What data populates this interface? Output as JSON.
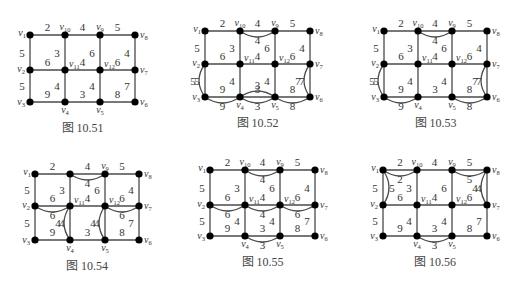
{
  "colors": {
    "edge": "#4a4a4a",
    "node": "#000000",
    "text": "#333333",
    "background": "#ffffff"
  },
  "figures": [
    {
      "caption": "图 10.51",
      "nodes": {
        "v1": [
          30,
          35
        ],
        "v10": [
          65,
          35
        ],
        "v9": [
          100,
          35
        ],
        "v8": [
          135,
          35
        ],
        "v2": [
          30,
          70
        ],
        "v11": [
          65,
          70
        ],
        "v12": [
          100,
          70
        ],
        "v7": [
          135,
          70
        ],
        "v3": [
          30,
          102
        ],
        "v4": [
          65,
          102
        ],
        "v5": [
          100,
          102
        ],
        "v6": [
          135,
          102
        ]
      },
      "edges": [
        {
          "a": "v1",
          "b": "v10",
          "w": "2"
        },
        {
          "a": "v10",
          "b": "v9",
          "w": "4"
        },
        {
          "a": "v9",
          "b": "v8",
          "w": "5"
        },
        {
          "a": "v1",
          "b": "v2",
          "w": "5"
        },
        {
          "a": "v10",
          "b": "v11",
          "w": "3"
        },
        {
          "a": "v9",
          "b": "v12",
          "w": "6"
        },
        {
          "a": "v8",
          "b": "v7",
          "w": "4"
        },
        {
          "a": "v2",
          "b": "v11",
          "w": "6"
        },
        {
          "a": "v11",
          "b": "v12",
          "w": "4"
        },
        {
          "a": "v12",
          "b": "v7",
          "w": "6"
        },
        {
          "a": "v2",
          "b": "v3",
          "w": "5"
        },
        {
          "a": "v11",
          "b": "v4",
          "w": "4"
        },
        {
          "a": "v12",
          "b": "v5",
          "w": "4"
        },
        {
          "a": "v7",
          "b": "v6",
          "w": "7"
        },
        {
          "a": "v3",
          "b": "v4",
          "w": "9"
        },
        {
          "a": "v4",
          "b": "v5",
          "w": "3"
        },
        {
          "a": "v5",
          "b": "v6",
          "w": "8"
        }
      ],
      "extra_edges": []
    },
    {
      "caption": "图 10.52",
      "nodes": {
        "v1": [
          205,
          31
        ],
        "v10": [
          240,
          31
        ],
        "v9": [
          275,
          31
        ],
        "v8": [
          310,
          31
        ],
        "v2": [
          205,
          64
        ],
        "v11": [
          240,
          64
        ],
        "v12": [
          275,
          64
        ],
        "v7": [
          310,
          64
        ],
        "v3": [
          205,
          97
        ],
        "v4": [
          240,
          97
        ],
        "v5": [
          275,
          97
        ],
        "v6": [
          310,
          97
        ]
      },
      "edges": [
        {
          "a": "v1",
          "b": "v10",
          "w": "2"
        },
        {
          "a": "v10",
          "b": "v9",
          "w": "4"
        },
        {
          "a": "v9",
          "b": "v8",
          "w": "5"
        },
        {
          "a": "v1",
          "b": "v2",
          "w": "5"
        },
        {
          "a": "v10",
          "b": "v11",
          "w": "3"
        },
        {
          "a": "v9",
          "b": "v12",
          "w": "6"
        },
        {
          "a": "v8",
          "b": "v7",
          "w": "4"
        },
        {
          "a": "v2",
          "b": "v11",
          "w": "6"
        },
        {
          "a": "v11",
          "b": "v12",
          "w": "4"
        },
        {
          "a": "v12",
          "b": "v7",
          "w": "6"
        },
        {
          "a": "v2",
          "b": "v3",
          "w": "5"
        },
        {
          "a": "v11",
          "b": "v4",
          "w": "4"
        },
        {
          "a": "v12",
          "b": "v5",
          "w": "4"
        },
        {
          "a": "v7",
          "b": "v6",
          "w": "7"
        },
        {
          "a": "v3",
          "b": "v4",
          "w": "9"
        },
        {
          "a": "v4",
          "b": "v5",
          "w": "3"
        },
        {
          "a": "v5",
          "b": "v6",
          "w": "8"
        }
      ],
      "extra_edges": [
        {
          "a": "v10",
          "b": "v9",
          "w": "4",
          "bend": "down"
        },
        {
          "a": "v2",
          "b": "v3",
          "w": "5",
          "bend": "left"
        },
        {
          "a": "v7",
          "b": "v6",
          "w": "7",
          "bend": "left"
        },
        {
          "a": "v3",
          "b": "v4",
          "w": "9",
          "bend": "down"
        },
        {
          "a": "v4",
          "b": "v5",
          "w": "3",
          "bend": "up"
        },
        {
          "a": "v4",
          "b": "v5",
          "w": "3",
          "bend": "down"
        },
        {
          "a": "v5",
          "b": "v6",
          "w": "8",
          "bend": "down"
        }
      ]
    },
    {
      "caption": "图 10.53",
      "nodes": {
        "v1": [
          384,
          31
        ],
        "v10": [
          418,
          31
        ],
        "v9": [
          452,
          31
        ],
        "v8": [
          487,
          31
        ],
        "v2": [
          384,
          64
        ],
        "v11": [
          418,
          64
        ],
        "v12": [
          452,
          64
        ],
        "v7": [
          487,
          64
        ],
        "v3": [
          384,
          97
        ],
        "v4": [
          418,
          97
        ],
        "v5": [
          452,
          97
        ],
        "v6": [
          487,
          97
        ]
      },
      "edges": [
        {
          "a": "v1",
          "b": "v10",
          "w": "2"
        },
        {
          "a": "v10",
          "b": "v9",
          "w": "4"
        },
        {
          "a": "v9",
          "b": "v8",
          "w": "5"
        },
        {
          "a": "v1",
          "b": "v2",
          "w": "5"
        },
        {
          "a": "v10",
          "b": "v11",
          "w": "3"
        },
        {
          "a": "v9",
          "b": "v12",
          "w": "6"
        },
        {
          "a": "v8",
          "b": "v7",
          "w": "4"
        },
        {
          "a": "v2",
          "b": "v11",
          "w": "6"
        },
        {
          "a": "v11",
          "b": "v12",
          "w": "4"
        },
        {
          "a": "v12",
          "b": "v7",
          "w": "6"
        },
        {
          "a": "v2",
          "b": "v3",
          "w": "5"
        },
        {
          "a": "v11",
          "b": "v4",
          "w": "4"
        },
        {
          "a": "v12",
          "b": "v5",
          "w": "4"
        },
        {
          "a": "v7",
          "b": "v6",
          "w": "7"
        },
        {
          "a": "v3",
          "b": "v4",
          "w": "9"
        },
        {
          "a": "v4",
          "b": "v5",
          "w": "3"
        },
        {
          "a": "v5",
          "b": "v6",
          "w": "8"
        }
      ],
      "extra_edges": [
        {
          "a": "v10",
          "b": "v9",
          "w": "4",
          "bend": "down"
        },
        {
          "a": "v2",
          "b": "v3",
          "w": "5",
          "bend": "left"
        },
        {
          "a": "v7",
          "b": "v6",
          "w": "7",
          "bend": "left"
        },
        {
          "a": "v3",
          "b": "v4",
          "w": "9",
          "bend": "down"
        },
        {
          "a": "v5",
          "b": "v6",
          "w": "8",
          "bend": "down"
        }
      ]
    },
    {
      "caption": "图 10.54",
      "nodes": {
        "v1": [
          35,
          174
        ],
        "v10": [
          70,
          174
        ],
        "v9": [
          105,
          174
        ],
        "v8": [
          139,
          174
        ],
        "v2": [
          35,
          206
        ],
        "v11": [
          70,
          206
        ],
        "v12": [
          105,
          206
        ],
        "v7": [
          139,
          206
        ],
        "v3": [
          35,
          240
        ],
        "v4": [
          70,
          240
        ],
        "v5": [
          105,
          240
        ],
        "v6": [
          139,
          240
        ]
      },
      "hidden_labels": [
        "v10"
      ],
      "edges": [
        {
          "a": "v1",
          "b": "v10",
          "w": "2"
        },
        {
          "a": "v10",
          "b": "v9",
          "w": "4"
        },
        {
          "a": "v9",
          "b": "v8",
          "w": "5"
        },
        {
          "a": "v1",
          "b": "v2",
          "w": "5"
        },
        {
          "a": "v10",
          "b": "v11",
          "w": "3"
        },
        {
          "a": "v9",
          "b": "v12",
          "w": "6"
        },
        {
          "a": "v8",
          "b": "v7",
          "w": "4"
        },
        {
          "a": "v2",
          "b": "v11",
          "w": "6"
        },
        {
          "a": "v11",
          "b": "v12",
          "w": "4"
        },
        {
          "a": "v12",
          "b": "v7",
          "w": "6"
        },
        {
          "a": "v2",
          "b": "v3",
          "w": "5"
        },
        {
          "a": "v11",
          "b": "v4",
          "w": "4"
        },
        {
          "a": "v12",
          "b": "v5",
          "w": "4"
        },
        {
          "a": "v7",
          "b": "v6",
          "w": "7"
        },
        {
          "a": "v3",
          "b": "v4",
          "w": "9"
        },
        {
          "a": "v4",
          "b": "v5",
          "w": "3"
        },
        {
          "a": "v5",
          "b": "v6",
          "w": "8"
        }
      ],
      "extra_edges": [
        {
          "a": "v10",
          "b": "v9",
          "w": "4",
          "bend": "down"
        },
        {
          "a": "v2",
          "b": "v11",
          "w": "6",
          "bend": "down"
        },
        {
          "a": "v11",
          "b": "v4",
          "w": "4",
          "bend": "left"
        },
        {
          "a": "v12",
          "b": "v5",
          "w": "4",
          "bend": "left"
        },
        {
          "a": "v12",
          "b": "v7",
          "w": "6",
          "bend": "down"
        }
      ]
    },
    {
      "caption": "图 10.55",
      "nodes": {
        "v1": [
          210,
          170
        ],
        "v10": [
          245,
          170
        ],
        "v9": [
          280,
          170
        ],
        "v8": [
          315,
          170
        ],
        "v2": [
          210,
          205
        ],
        "v11": [
          245,
          205
        ],
        "v12": [
          280,
          205
        ],
        "v7": [
          315,
          205
        ],
        "v3": [
          210,
          236
        ],
        "v4": [
          245,
          236
        ],
        "v5": [
          280,
          236
        ],
        "v6": [
          315,
          236
        ]
      },
      "edges": [
        {
          "a": "v1",
          "b": "v10",
          "w": "2"
        },
        {
          "a": "v10",
          "b": "v9",
          "w": "4"
        },
        {
          "a": "v9",
          "b": "v8",
          "w": "5"
        },
        {
          "a": "v1",
          "b": "v2",
          "w": "5"
        },
        {
          "a": "v10",
          "b": "v11",
          "w": "3"
        },
        {
          "a": "v9",
          "b": "v12",
          "w": "6"
        },
        {
          "a": "v8",
          "b": "v7",
          "w": "4"
        },
        {
          "a": "v2",
          "b": "v11",
          "w": "6"
        },
        {
          "a": "v11",
          "b": "v12",
          "w": "4"
        },
        {
          "a": "v12",
          "b": "v7",
          "w": "6"
        },
        {
          "a": "v2",
          "b": "v3",
          "w": "5"
        },
        {
          "a": "v11",
          "b": "v4",
          "w": "4"
        },
        {
          "a": "v12",
          "b": "v5",
          "w": "4"
        },
        {
          "a": "v7",
          "b": "v6",
          "w": "7"
        },
        {
          "a": "v3",
          "b": "v4",
          "w": "9"
        },
        {
          "a": "v4",
          "b": "v5",
          "w": "3"
        },
        {
          "a": "v5",
          "b": "v6",
          "w": "8"
        }
      ],
      "extra_edges": [
        {
          "a": "v10",
          "b": "v9",
          "w": "4",
          "bend": "down"
        },
        {
          "a": "v2",
          "b": "v11",
          "w": "6",
          "bend": "down"
        },
        {
          "a": "v11",
          "b": "v12",
          "w": "4",
          "bend": "down"
        },
        {
          "a": "v12",
          "b": "v7",
          "w": "6",
          "bend": "down"
        },
        {
          "a": "v4",
          "b": "v5",
          "w": "3",
          "bend": "down"
        }
      ]
    },
    {
      "caption": "图 10.56",
      "nodes": {
        "v1": [
          383,
          170
        ],
        "v10": [
          417,
          170
        ],
        "v9": [
          452,
          170
        ],
        "v8": [
          487,
          170
        ],
        "v2": [
          383,
          205
        ],
        "v11": [
          417,
          205
        ],
        "v12": [
          452,
          205
        ],
        "v7": [
          487,
          205
        ],
        "v3": [
          383,
          236
        ],
        "v4": [
          417,
          236
        ],
        "v5": [
          452,
          236
        ],
        "v6": [
          487,
          236
        ]
      },
      "edges": [
        {
          "a": "v1",
          "b": "v10",
          "w": "2"
        },
        {
          "a": "v10",
          "b": "v9",
          "w": "4"
        },
        {
          "a": "v9",
          "b": "v8",
          "w": "5"
        },
        {
          "a": "v1",
          "b": "v2",
          "w": "5"
        },
        {
          "a": "v10",
          "b": "v11",
          "w": "3"
        },
        {
          "a": "v9",
          "b": "v12",
          "w": "6"
        },
        {
          "a": "v8",
          "b": "v7",
          "w": "4"
        },
        {
          "a": "v2",
          "b": "v11",
          "w": "6"
        },
        {
          "a": "v11",
          "b": "v12",
          "w": "4"
        },
        {
          "a": "v12",
          "b": "v7",
          "w": "6"
        },
        {
          "a": "v2",
          "b": "v3",
          "w": "5"
        },
        {
          "a": "v11",
          "b": "v4",
          "w": "4"
        },
        {
          "a": "v12",
          "b": "v5",
          "w": "4"
        },
        {
          "a": "v7",
          "b": "v6",
          "w": "7"
        },
        {
          "a": "v3",
          "b": "v4",
          "w": "9"
        },
        {
          "a": "v4",
          "b": "v5",
          "w": "3"
        },
        {
          "a": "v5",
          "b": "v6",
          "w": "8"
        }
      ],
      "extra_edges": [
        {
          "a": "v1",
          "b": "v10",
          "w": "2",
          "bend": "down"
        },
        {
          "a": "v1",
          "b": "v2",
          "w": "5",
          "bend": "right"
        },
        {
          "a": "v9",
          "b": "v8",
          "w": "5",
          "bend": "down"
        },
        {
          "a": "v8",
          "b": "v7",
          "w": "4",
          "bend": "left"
        },
        {
          "a": "v4",
          "b": "v5",
          "w": "3",
          "bend": "down"
        }
      ]
    }
  ]
}
